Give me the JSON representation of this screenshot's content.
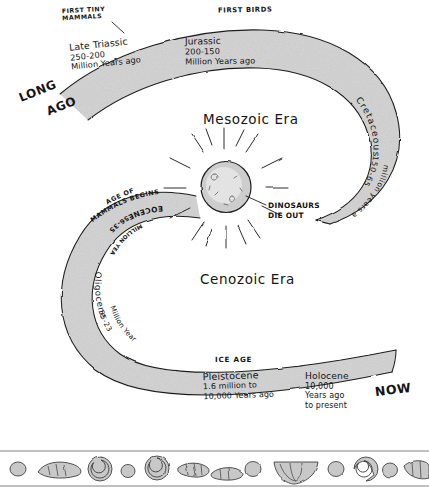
{
  "figure": {
    "type": "hand-drawn-timeline",
    "title_visible": false,
    "background_color": "#ffffff",
    "band_color": "#d8d8d8",
    "ink_color": "#141414"
  },
  "eras": [
    {
      "name": "Mesozoic Era"
    },
    {
      "name": "Cenozoic Era"
    }
  ],
  "direction_labels": {
    "start": "LONG",
    "start2": "AGO",
    "end": "NOW"
  },
  "periods": [
    {
      "id": "late-triassic",
      "name": "Late Triassic",
      "range": "250-200",
      "units": "Million Years ago",
      "era": "Mesozoic Era"
    },
    {
      "id": "jurassic",
      "name": "Jurassic",
      "range": "200-150",
      "units": "Million Years ago",
      "era": "Mesozoic Era"
    },
    {
      "id": "cretaceous",
      "name": "Cretaceous",
      "range": "150-65",
      "units": "million years ago",
      "era": "Mesozoic Era"
    },
    {
      "id": "eocene",
      "name": "EOCENE",
      "range": "56-35",
      "units": "MILLION YEARS AGO",
      "era": "Cenozoic Era"
    },
    {
      "id": "oligocene",
      "name": "Oligocene",
      "range": "55-23",
      "units": "Million Years ago",
      "era": "Cenozoic Era"
    },
    {
      "id": "pleistocene",
      "name": "Pleistocene",
      "range": "1.6 million to",
      "units": "10,000 Years ago",
      "era": "Cenozoic Era"
    },
    {
      "id": "holocene",
      "name": "Holocene",
      "range": "10,000",
      "units": "Years ago",
      "units2": "to present",
      "era": "Cenozoic Era"
    }
  ],
  "events": [
    {
      "id": "first-tiny-mammals",
      "label": "FIRST TINY\nMAMMALS"
    },
    {
      "id": "first-birds",
      "label": "First Birds"
    },
    {
      "id": "dinosaurs-die-out",
      "label": "Dinosaurs\nDie out"
    },
    {
      "id": "age-of-mammals-begins",
      "label": "AGE OF\nMAMMALS BEGINS"
    },
    {
      "id": "ice-age",
      "label": "ICE AGE"
    }
  ],
  "impact": {
    "name": "asteroid-impact",
    "ray_count": 16
  },
  "arc_text": {
    "cretaceous_name": "Cretaceous",
    "cretaceous_range": "150-65",
    "cretaceous_units": "million years ago",
    "eocene_name": "EOCENE",
    "eocene_range": "56-35",
    "eocene_units": "MILLION YEARS AGO",
    "oligocene_name": "Oligocene",
    "oligocene_range": "55-23",
    "oligocene_units": "Million Years ago",
    "agemammals_line1": "AGE OF",
    "agemammals_line2": "MAMMALS BEGINS"
  },
  "fossil_border": {
    "name": "fossil-border",
    "items": [
      "pebble",
      "trilobite",
      "ammonite",
      "pebble",
      "ammonite",
      "trilobite",
      "trilobite",
      "pebble",
      "pebble",
      "shell",
      "pebble",
      "ammonite",
      "pebble",
      "trilobite",
      "pebble"
    ]
  }
}
